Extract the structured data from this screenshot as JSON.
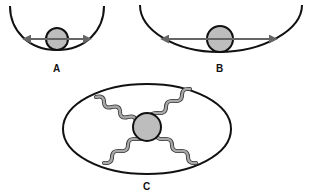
{
  "diagram": {
    "panels": [
      {
        "id": "A",
        "label": "A",
        "description": "Ball in narrow curved well with double-headed oscillation arrow"
      },
      {
        "id": "B",
        "label": "B",
        "description": "Ball in wide shallow well with longer double-headed arrow"
      },
      {
        "id": "C",
        "label": "C",
        "description": "Ball suspended by four springs inside an ellipse"
      }
    ],
    "colors": {
      "outline": "#111111",
      "ball_fill": "#bdbdbd",
      "arrow": "#666666",
      "spring": "#a8a8a8",
      "background": "#ffffff"
    }
  }
}
